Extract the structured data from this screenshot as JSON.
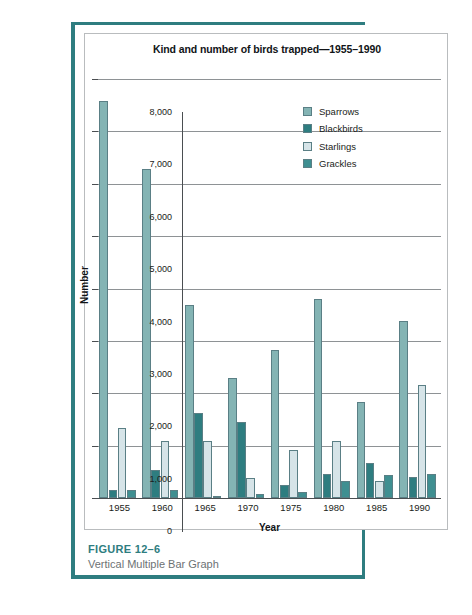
{
  "figure": {
    "number_label": "FIGURE 12–6",
    "caption": "Vertical Multiple Bar Graph"
  },
  "chart_data": {
    "type": "bar",
    "title": "Kind and number of birds trapped—1955–1990",
    "xlabel": "Year",
    "ylabel": "Number",
    "categories": [
      "1955",
      "1960",
      "1965",
      "1970",
      "1975",
      "1980",
      "1985",
      "1990"
    ],
    "ylim": [
      0,
      8000
    ],
    "yticks": [
      0,
      1000,
      2000,
      3000,
      4000,
      5000,
      6000,
      7000,
      8000
    ],
    "ytick_labels": [
      "0",
      "1,000",
      "2,000",
      "3,000",
      "4,000",
      "5,000",
      "6,000",
      "7,000",
      "8,000"
    ],
    "grid": true,
    "legend_position": "upper-right-inside",
    "series": [
      {
        "name": "Sparrows",
        "color": "#84b4b4",
        "values": [
          7580,
          6280,
          3680,
          2300,
          2830,
          3800,
          1830,
          3380
        ]
      },
      {
        "name": "Blackbirds",
        "color": "#2e7d80",
        "values": [
          150,
          540,
          1620,
          1460,
          250,
          460,
          670,
          400
        ]
      },
      {
        "name": "Starlings",
        "color": "#d6e4e8",
        "values": [
          1340,
          1080,
          1090,
          390,
          910,
          1090,
          320,
          2160
        ]
      },
      {
        "name": "Grackles",
        "color": "#3f8f91",
        "values": [
          160,
          150,
          40,
          70,
          120,
          320,
          430,
          450
        ]
      }
    ]
  }
}
